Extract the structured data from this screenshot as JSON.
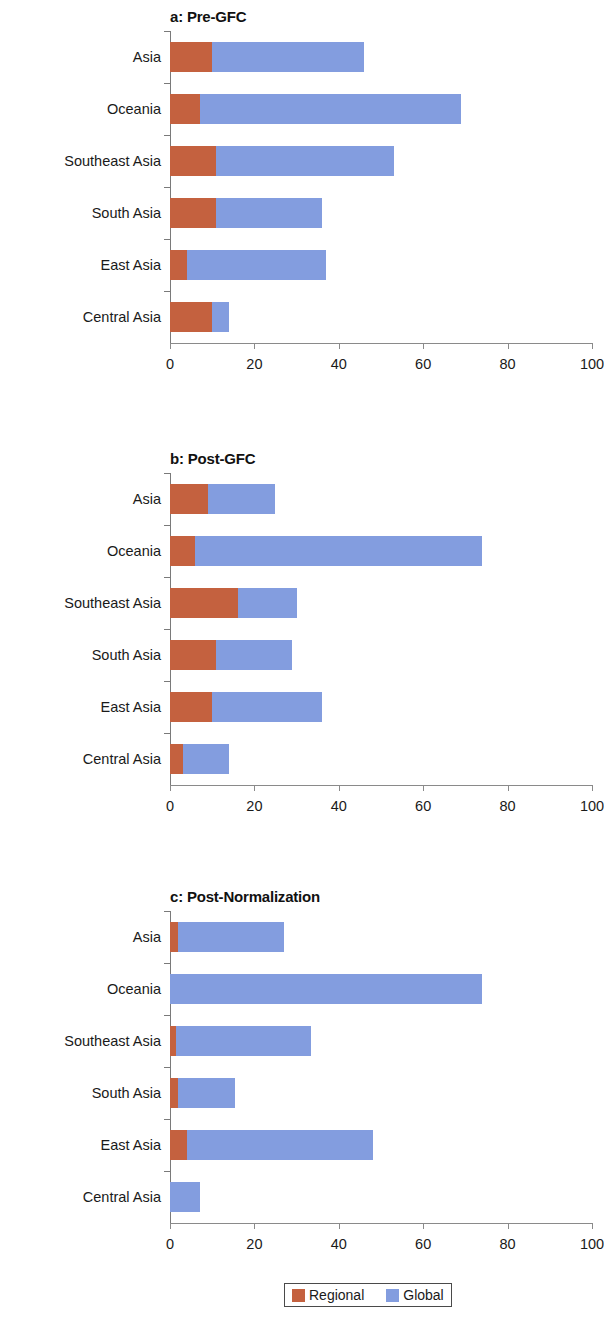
{
  "figure": {
    "legend": {
      "items": [
        {
          "label": "Regional",
          "color": "#c4613f",
          "key": "regional"
        },
        {
          "label": "Global",
          "color": "#839ddf",
          "key": "global"
        }
      ]
    }
  },
  "chart_data": [
    {
      "type": "bar",
      "orientation": "horizontal",
      "stacked": true,
      "title": "a: Pre-GFC",
      "xlabel": "",
      "ylabel": "",
      "xlim": [
        0,
        100
      ],
      "xticks": [
        0,
        20,
        40,
        60,
        80,
        100
      ],
      "xticklabels": [
        "0",
        "20",
        "40",
        "60",
        "80",
        "100"
      ],
      "grid": false,
      "legend_position": "bottom",
      "categories": [
        "Asia",
        "Oceania",
        "Southeast Asia",
        "South Asia",
        "East Asia",
        "Central Asia"
      ],
      "series": [
        {
          "name": "Regional",
          "color": "#c4613f",
          "values": [
            10,
            7,
            11,
            11,
            4,
            10
          ]
        },
        {
          "name": "Global",
          "color": "#839ddf",
          "values": [
            36,
            62,
            42,
            25,
            33,
            4
          ]
        }
      ],
      "totals": [
        46,
        69,
        53,
        36,
        37,
        14
      ]
    },
    {
      "type": "bar",
      "orientation": "horizontal",
      "stacked": true,
      "title": "b: Post-GFC",
      "xlabel": "",
      "ylabel": "",
      "xlim": [
        0,
        100
      ],
      "xticks": [
        0,
        20,
        40,
        60,
        80,
        100
      ],
      "xticklabels": [
        "0",
        "20",
        "40",
        "60",
        "80",
        "100"
      ],
      "grid": false,
      "legend_position": "bottom",
      "categories": [
        "Asia",
        "Oceania",
        "Southeast Asia",
        "South Asia",
        "East Asia",
        "Central Asia"
      ],
      "series": [
        {
          "name": "Regional",
          "color": "#c4613f",
          "values": [
            9,
            6,
            16,
            11,
            10,
            3
          ]
        },
        {
          "name": "Global",
          "color": "#839ddf",
          "values": [
            16,
            68,
            14,
            18,
            26,
            11
          ]
        }
      ],
      "totals": [
        25,
        74,
        30,
        29,
        36,
        14
      ]
    },
    {
      "type": "bar",
      "orientation": "horizontal",
      "stacked": true,
      "title": "c: Post-Normalization",
      "xlabel": "",
      "ylabel": "",
      "xlim": [
        0,
        100
      ],
      "xticks": [
        0,
        20,
        40,
        60,
        80,
        100
      ],
      "xticklabels": [
        "0",
        "20",
        "40",
        "60",
        "80",
        "100"
      ],
      "grid": false,
      "legend_position": "bottom",
      "categories": [
        "Asia",
        "Oceania",
        "Southeast Asia",
        "South Asia",
        "East Asia",
        "Central Asia"
      ],
      "series": [
        {
          "name": "Regional",
          "color": "#c4613f",
          "values": [
            2,
            0,
            1.5,
            2,
            4,
            0
          ]
        },
        {
          "name": "Global",
          "color": "#839ddf",
          "values": [
            25,
            74,
            32,
            13.5,
            44,
            7
          ]
        }
      ],
      "totals": [
        27,
        74,
        33.5,
        15.5,
        48,
        7
      ]
    }
  ]
}
